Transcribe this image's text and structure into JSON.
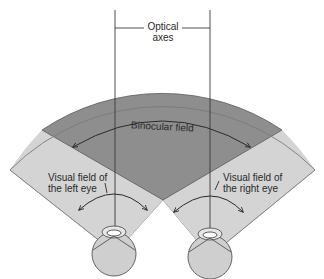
{
  "labels": {
    "optical_axes_line1": "Optical",
    "optical_axes_line2": "axes",
    "binocular_field": "Binocular field",
    "left_field_line1": "Visual field of",
    "left_field_line2": "the left eye",
    "right_field_line1": "Visual field of",
    "right_field_line2": "the right eye"
  },
  "colors": {
    "binocular_region": "#8e8e8e",
    "monocular_region": "#d4d4d4",
    "eye_fill": "#cfcfcf",
    "line": "#3a3a3a",
    "background": "#ffffff"
  },
  "elements": {
    "left_eye": "eye diagram (left)",
    "right_eye": "eye diagram (right)",
    "left_optical_axis": "vertical line through left eye",
    "right_optical_axis": "vertical line through right eye"
  }
}
